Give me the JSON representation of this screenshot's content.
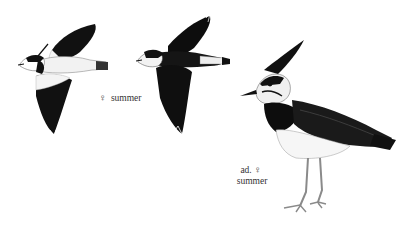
{
  "plate": {
    "subject": "Northern Lapwing illustrations",
    "captions": {
      "flying_female": {
        "symbol": "♀",
        "label": "summer"
      },
      "standing_adult": {
        "prefix": "ad.",
        "symbol": "♀",
        "label": "summer"
      }
    },
    "colors": {
      "background": "#ffffff",
      "ink": "#111111",
      "grey": "#8a8a8a"
    }
  }
}
